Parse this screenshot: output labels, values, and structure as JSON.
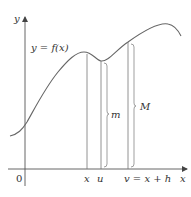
{
  "diagram": {
    "axes": {
      "y_label": "y",
      "x_label": "x",
      "origin_label": "0"
    },
    "curve_label": "y = f(x)",
    "points": [
      {
        "label": "x"
      },
      {
        "label": "u"
      },
      {
        "label": "v = x + h"
      }
    ],
    "braces": [
      {
        "label": "m"
      },
      {
        "label": "M"
      }
    ],
    "colors": {
      "stroke": "#666666",
      "text": "#333333",
      "background": "#ffffff"
    }
  }
}
